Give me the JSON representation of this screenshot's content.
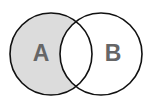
{
  "diagram": {
    "type": "venn",
    "shaded_region": "A only (A minus B)",
    "sets": [
      {
        "id": "A",
        "label": "A",
        "cx": 51,
        "cy": 54,
        "r": 41
      },
      {
        "id": "B",
        "label": "B",
        "cx": 101,
        "cy": 54,
        "r": 41
      }
    ],
    "colors": {
      "shade": "#dcdcdc",
      "stroke": "#111111",
      "label": "#666666",
      "background": "#ffffff"
    }
  }
}
